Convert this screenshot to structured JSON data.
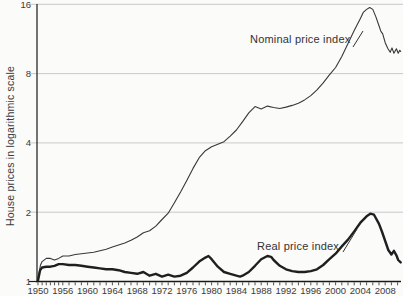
{
  "chart_data": {
    "type": "line",
    "title": "",
    "xlabel": "",
    "ylabel": "House prices in logarithmic scale",
    "y_scale": "log2",
    "ylim": [
      1,
      16
    ],
    "xlim": [
      1950,
      2010.5
    ],
    "y_ticks": [
      1,
      2,
      4,
      8,
      16
    ],
    "x_tick_labels": [
      "1950",
      "1956",
      "1960",
      "1964",
      "1968",
      "1972",
      "1976",
      "1980",
      "1984",
      "1988",
      "1992",
      "1996",
      "2000",
      "2004",
      "2008"
    ],
    "x_tick_years": [
      1950,
      1956,
      1960,
      1964,
      1968,
      1972,
      1976,
      1980,
      1984,
      1988,
      1992,
      1996,
      2000,
      2004,
      2008
    ],
    "minor_ticks_years": {
      "start": 1950,
      "end": 2010,
      "step": 1
    },
    "grid": "horizontal-light",
    "legend_position": "inline-annotations",
    "colors": {
      "grid": "#c9c9c9",
      "axis": "#1a1a1a",
      "tick_text": "#3c3c3c"
    },
    "series": [
      {
        "name": "Nominal price index",
        "color": "#383838",
        "stroke_width": 1.1,
        "points": [
          [
            1950,
            1.03
          ],
          [
            1950.6,
            1.18
          ],
          [
            1951,
            1.22
          ],
          [
            1952,
            1.26
          ],
          [
            1953,
            1.26
          ],
          [
            1954,
            1.24
          ],
          [
            1955,
            1.26
          ],
          [
            1956,
            1.29
          ],
          [
            1957,
            1.29
          ],
          [
            1958,
            1.31
          ],
          [
            1959,
            1.32
          ],
          [
            1960,
            1.33
          ],
          [
            1961,
            1.34
          ],
          [
            1962,
            1.36
          ],
          [
            1963,
            1.38
          ],
          [
            1964,
            1.41
          ],
          [
            1965,
            1.44
          ],
          [
            1966,
            1.47
          ],
          [
            1967,
            1.51
          ],
          [
            1968,
            1.56
          ],
          [
            1969,
            1.63
          ],
          [
            1970,
            1.66
          ],
          [
            1971,
            1.74
          ],
          [
            1972,
            1.86
          ],
          [
            1973,
            1.98
          ],
          [
            1974,
            2.2
          ],
          [
            1975,
            2.45
          ],
          [
            1976,
            2.75
          ],
          [
            1977,
            3.1
          ],
          [
            1978,
            3.45
          ],
          [
            1979,
            3.7
          ],
          [
            1980,
            3.85
          ],
          [
            1981,
            3.95
          ],
          [
            1982,
            4.05
          ],
          [
            1983,
            4.28
          ],
          [
            1984,
            4.55
          ],
          [
            1985,
            4.95
          ],
          [
            1986,
            5.4
          ],
          [
            1987,
            5.75
          ],
          [
            1988,
            5.62
          ],
          [
            1989,
            5.78
          ],
          [
            1990,
            5.7
          ],
          [
            1991,
            5.64
          ],
          [
            1992,
            5.72
          ],
          [
            1993,
            5.82
          ],
          [
            1994,
            5.95
          ],
          [
            1995,
            6.15
          ],
          [
            1996,
            6.42
          ],
          [
            1997,
            6.8
          ],
          [
            1998,
            7.3
          ],
          [
            1999,
            7.9
          ],
          [
            2000,
            8.5
          ],
          [
            2001,
            9.5
          ],
          [
            2002,
            10.8
          ],
          [
            2003,
            12.3
          ],
          [
            2004,
            13.9
          ],
          [
            2004.5,
            14.8
          ],
          [
            2005,
            15.2
          ],
          [
            2005.5,
            15.5
          ],
          [
            2006,
            15.2
          ],
          [
            2006.5,
            14.1
          ],
          [
            2007,
            12.9
          ],
          [
            2007.3,
            12.2
          ],
          [
            2007.6,
            11.9
          ],
          [
            2008,
            10.9
          ],
          [
            2008.4,
            10.3
          ],
          [
            2008.8,
            9.9
          ],
          [
            2009.1,
            10.35
          ],
          [
            2009.4,
            9.8
          ],
          [
            2009.8,
            10.25
          ],
          [
            2010.1,
            9.8
          ],
          [
            2010.35,
            10.1
          ],
          [
            2010.5,
            10.0
          ]
        ]
      },
      {
        "name": "Real price index",
        "color": "#1f1f1f",
        "stroke_width": 2.4,
        "points": [
          [
            1950,
            1.01
          ],
          [
            1950.5,
            1.12
          ],
          [
            1951,
            1.15
          ],
          [
            1952,
            1.16
          ],
          [
            1953,
            1.16
          ],
          [
            1954,
            1.17
          ],
          [
            1955,
            1.19
          ],
          [
            1956,
            1.19
          ],
          [
            1957,
            1.18
          ],
          [
            1958,
            1.18
          ],
          [
            1959,
            1.17
          ],
          [
            1960,
            1.16
          ],
          [
            1961,
            1.15
          ],
          [
            1962,
            1.14
          ],
          [
            1963,
            1.13
          ],
          [
            1964,
            1.13
          ],
          [
            1965,
            1.12
          ],
          [
            1966,
            1.1
          ],
          [
            1967,
            1.09
          ],
          [
            1968,
            1.08
          ],
          [
            1969,
            1.1
          ],
          [
            1970,
            1.06
          ],
          [
            1971,
            1.08
          ],
          [
            1972,
            1.05
          ],
          [
            1973,
            1.07
          ],
          [
            1974,
            1.05
          ],
          [
            1975,
            1.06
          ],
          [
            1976,
            1.09
          ],
          [
            1977,
            1.15
          ],
          [
            1978,
            1.22
          ],
          [
            1979,
            1.27
          ],
          [
            1979.5,
            1.29
          ],
          [
            1980,
            1.25
          ],
          [
            1981,
            1.16
          ],
          [
            1982,
            1.1
          ],
          [
            1983,
            1.08
          ],
          [
            1984,
            1.06
          ],
          [
            1984.6,
            1.05
          ],
          [
            1985,
            1.06
          ],
          [
            1986,
            1.1
          ],
          [
            1987,
            1.17
          ],
          [
            1988,
            1.25
          ],
          [
            1989,
            1.29
          ],
          [
            1989.6,
            1.28
          ],
          [
            1990,
            1.24
          ],
          [
            1991,
            1.17
          ],
          [
            1992,
            1.13
          ],
          [
            1993,
            1.11
          ],
          [
            1994,
            1.1
          ],
          [
            1995,
            1.1
          ],
          [
            1996,
            1.11
          ],
          [
            1997,
            1.13
          ],
          [
            1998,
            1.18
          ],
          [
            1999,
            1.25
          ],
          [
            2000,
            1.32
          ],
          [
            2001,
            1.42
          ],
          [
            2002,
            1.52
          ],
          [
            2003,
            1.65
          ],
          [
            2004,
            1.8
          ],
          [
            2005,
            1.92
          ],
          [
            2005.6,
            1.97
          ],
          [
            2006.2,
            1.95
          ],
          [
            2007,
            1.78
          ],
          [
            2007.5,
            1.64
          ],
          [
            2008,
            1.5
          ],
          [
            2008.5,
            1.37
          ],
          [
            2009,
            1.31
          ],
          [
            2009.4,
            1.36
          ],
          [
            2009.8,
            1.3
          ],
          [
            2010.1,
            1.24
          ],
          [
            2010.5,
            1.21
          ]
        ]
      }
    ]
  }
}
